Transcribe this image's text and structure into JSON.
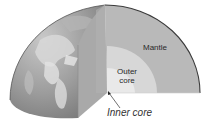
{
  "diagram": {
    "labels": {
      "mantle": "Mantle",
      "outer_core_line1": "Outer",
      "outer_core_line2": "core",
      "inner_core": "Inner core"
    },
    "colors": {
      "mantle": "#b9b9b9",
      "outer_core": "#d7d7d7",
      "inner_core": "#ececec",
      "front_cut_face": "#a9a9a9",
      "globe_surface": "#9a9a9a",
      "outline": "#3a3a3a"
    }
  }
}
